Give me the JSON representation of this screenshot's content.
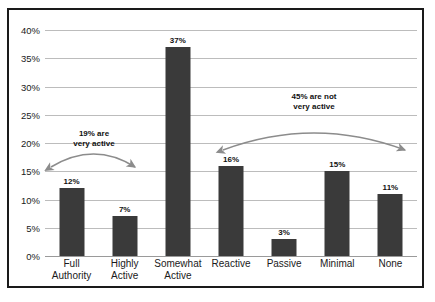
{
  "chart_data": {
    "type": "bar",
    "title": "",
    "subtitle": "",
    "xlabel": "",
    "ylabel": "",
    "ylim": [
      0,
      40
    ],
    "ytick_step": 5,
    "ytick_labels": [
      "0%",
      "5%",
      "10%",
      "15%",
      "20%",
      "25%",
      "30%",
      "35%",
      "40%"
    ],
    "ytick_values": [
      0,
      5,
      10,
      15,
      20,
      25,
      30,
      35,
      40
    ],
    "grid": true,
    "legend": false,
    "legend_position": "none",
    "categories": [
      "Full Authority",
      "Highly Active",
      "Somewhat Active",
      "Reactive",
      "Passive",
      "Minimal",
      "None"
    ],
    "category_lines": [
      [
        "Full",
        "Authority"
      ],
      [
        "Highly",
        "Active"
      ],
      [
        "Somewhat",
        "Active"
      ],
      [
        "Reactive",
        ""
      ],
      [
        "Passive",
        ""
      ],
      [
        "Minimal",
        ""
      ],
      [
        "None",
        ""
      ]
    ],
    "values": [
      12,
      7,
      37,
      16,
      3,
      15,
      11
    ],
    "data_labels": [
      "12%",
      "7%",
      "37%",
      "16%",
      "3%",
      "15%",
      "11%"
    ],
    "bar_color": "#3a3a3a",
    "gridline_color": "#bcbcbc",
    "frame_color": "#1a1a1a",
    "background_color": "#ffffff",
    "annotations": [
      {
        "id": "very-active",
        "text_line1": "19% are",
        "text_line2": "very active",
        "value": 19,
        "spans_categories": [
          "Full Authority",
          "Highly Active"
        ],
        "arrow_color": "#8c8c8c",
        "arrow_style": "double-headed-curved"
      },
      {
        "id": "not-very-active",
        "text_line1": "45% are not",
        "text_line2": "very active",
        "value": 45,
        "spans_categories": [
          "Reactive",
          "Passive",
          "Minimal",
          "None"
        ],
        "arrow_color": "#8c8c8c",
        "arrow_style": "double-headed-curved"
      }
    ]
  }
}
